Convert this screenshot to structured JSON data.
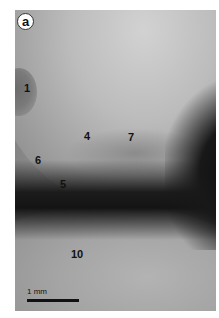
{
  "figure": {
    "panel_label": "a",
    "image_type": "grayscale micrograph",
    "labels": [
      {
        "id": "1",
        "text": "1"
      },
      {
        "id": "4",
        "text": "4"
      },
      {
        "id": "7",
        "text": "7"
      },
      {
        "id": "6",
        "text": "6"
      },
      {
        "id": "5",
        "text": "5"
      },
      {
        "id": "10",
        "text": "10"
      }
    ],
    "scale_bar": {
      "text": "1 mm"
    }
  }
}
